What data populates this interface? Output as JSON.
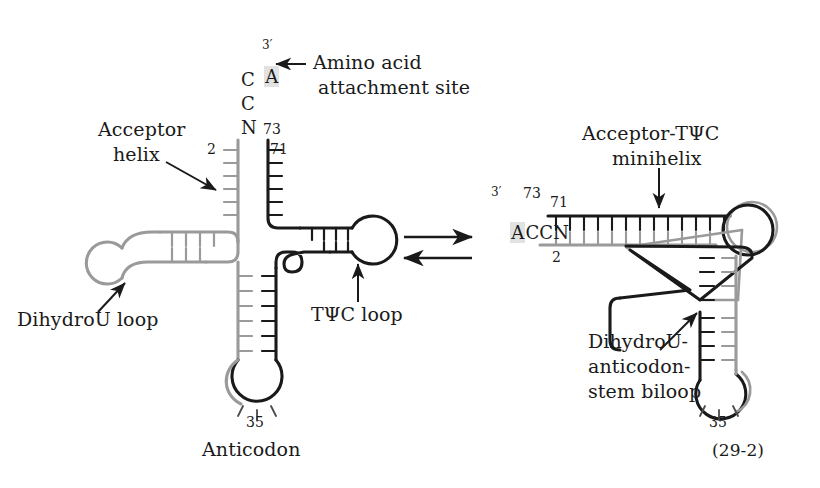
{
  "figure": {
    "reference_number": "(29-2)",
    "background_color": "#ffffff",
    "ink_color": "#1a1a1a",
    "strand_5prime_color": "#9a9a9a",
    "strand_3prime_color": "#1a1a1a",
    "highlight_color": "#e2e2e2"
  },
  "equilibrium": {
    "symbol_name": "equilibrium-double-arrow",
    "direction_forward": "right",
    "direction_reverse": "left"
  },
  "left_structure": {
    "name": "cloverleaf",
    "acceptor_end": {
      "bases": [
        "A",
        "C",
        "C",
        "N"
      ],
      "highlighted_base": "A",
      "prime_label": "3′",
      "position_73": "73",
      "position_71": "71",
      "position_2": "2"
    },
    "labels": {
      "amino_acid_site_line1": "Amino acid",
      "amino_acid_site_line2": "attachment site",
      "acceptor_helix_line1": "Acceptor",
      "acceptor_helix_line2": "helix",
      "dihydrou_loop": "DihydroU loop",
      "tpsic_loop": "TΨC loop",
      "anticodon": "Anticodon",
      "anticodon_position": "35"
    }
  },
  "right_structure": {
    "name": "l-shaped-tertiary-fold",
    "acceptor_end": {
      "bases": [
        "A",
        "C",
        "C",
        "N"
      ],
      "highlighted_base": "A",
      "prime_label": "3′",
      "position_73": "73",
      "position_71": "71",
      "position_2": "2"
    },
    "labels": {
      "minihelix_line1": "Acceptor-TΨC",
      "minihelix_line2": "minihelix",
      "biloop_line1": "DihydroU-",
      "biloop_line2": "anticodon-",
      "biloop_line3": "stem biloop",
      "anticodon_position": "35"
    }
  }
}
